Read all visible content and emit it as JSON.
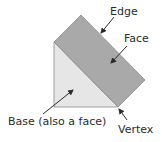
{
  "diagram": {
    "type": "labeled-geometry",
    "colors": {
      "base_fill": "#e6e6e6",
      "face_fill": "#a9a9a9",
      "outline": "#8a8a8a",
      "text": "#2b2b2b",
      "arrow": "#2b2b2b"
    },
    "labels": {
      "edge": "Edge",
      "face": "Face",
      "base": "Base (also a face)",
      "vertex": "Vertex"
    }
  }
}
